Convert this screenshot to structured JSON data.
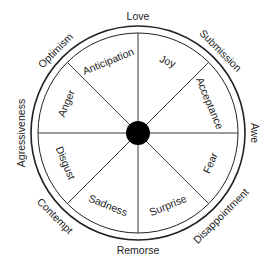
{
  "diagram": {
    "type": "emotion-wheel",
    "center": {
      "x": 138,
      "y": 133
    },
    "outer_ring_radius": 107,
    "inner_ring_radius": 100,
    "hub_radius": 12,
    "colors": {
      "line": "#222222",
      "hub": "#000000",
      "background": "#ffffff"
    },
    "primary_emotions": [
      {
        "label": "Joy",
        "angle": -67.5
      },
      {
        "label": "Acceptance",
        "angle": -22.5
      },
      {
        "label": "Fear",
        "angle": 22.5
      },
      {
        "label": "Surprise",
        "angle": 67.5
      },
      {
        "label": "Sadness",
        "angle": 112.5
      },
      {
        "label": "Disgust",
        "angle": 157.5
      },
      {
        "label": "Anger",
        "angle": 202.5
      },
      {
        "label": "Anticipation",
        "angle": 247.5
      }
    ],
    "dyads": [
      {
        "label": "Love",
        "angle": -90
      },
      {
        "label": "Submission",
        "angle": -45
      },
      {
        "label": "Awe",
        "angle": 0
      },
      {
        "label": "Disappointment",
        "angle": 45
      },
      {
        "label": "Remorse",
        "angle": 90
      },
      {
        "label": "Contempt",
        "angle": 135
      },
      {
        "label": "Agressiveness",
        "angle": 180
      },
      {
        "label": "Optimism",
        "angle": 225
      }
    ]
  }
}
